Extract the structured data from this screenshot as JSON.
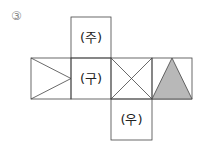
{
  "problem_number": "③",
  "faces": {
    "top": "(주)",
    "middle": "(구)",
    "bottom": "(우)"
  },
  "colors": {
    "line": "#333333",
    "shade": "#b8b8b8"
  }
}
